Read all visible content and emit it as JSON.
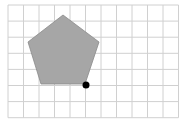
{
  "diagram": {
    "grid": {
      "cols": 11,
      "rows": 7,
      "x0": 8,
      "y0": 5,
      "cell_w": 15.5,
      "cell_h": 16.1,
      "line_color": "#d0d0d0"
    },
    "pentagon": {
      "points": "63,15 99,42 85,84 41,84 28,42",
      "fill": "#a6a6a6",
      "stroke": "#8a8a8a"
    },
    "point": {
      "cx": 86,
      "cy": 85,
      "r": 3.5,
      "fill": "#000000"
    }
  }
}
